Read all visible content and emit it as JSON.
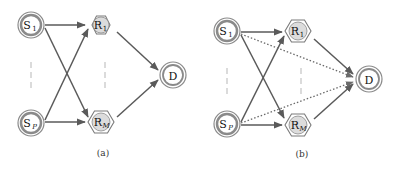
{
  "panels": [
    {
      "id": "a",
      "caption": "(a)",
      "nodes": {
        "s1": {
          "main": "S",
          "sub": "1",
          "shape": "double-circle"
        },
        "sp": {
          "main": "S",
          "sub": "P",
          "shape": "double-circle"
        },
        "r1": {
          "main": "R",
          "sub": "1",
          "shape": "hexagon-filled-circle"
        },
        "rm": {
          "main": "R",
          "sub": "M",
          "shape": "hexagon-filled-circle"
        },
        "d": {
          "main": "D",
          "shape": "double-circle"
        }
      },
      "edges": [
        {
          "from": "S1",
          "to": "R1",
          "style": "solid"
        },
        {
          "from": "S1",
          "to": "RM",
          "style": "solid"
        },
        {
          "from": "SP",
          "to": "R1",
          "style": "solid"
        },
        {
          "from": "SP",
          "to": "RM",
          "style": "solid"
        },
        {
          "from": "R1",
          "to": "D",
          "style": "solid"
        },
        {
          "from": "RM",
          "to": "D",
          "style": "solid"
        }
      ]
    },
    {
      "id": "b",
      "caption": "(b)",
      "nodes": {
        "s1": {
          "main": "S",
          "sub": "1",
          "shape": "double-circle"
        },
        "sp": {
          "main": "S",
          "sub": "P",
          "shape": "double-circle"
        },
        "r1": {
          "main": "R",
          "sub": "1",
          "shape": "hexagon-filled-circle"
        },
        "rm": {
          "main": "R",
          "sub": "M",
          "shape": "hexagon-filled-circle"
        },
        "d": {
          "main": "D",
          "shape": "double-circle"
        }
      },
      "edges": [
        {
          "from": "S1",
          "to": "R1",
          "style": "solid"
        },
        {
          "from": "S1",
          "to": "RM",
          "style": "solid"
        },
        {
          "from": "SP",
          "to": "R1",
          "style": "solid"
        },
        {
          "from": "SP",
          "to": "RM",
          "style": "solid"
        },
        {
          "from": "R1",
          "to": "D",
          "style": "solid"
        },
        {
          "from": "RM",
          "to": "D",
          "style": "solid"
        },
        {
          "from": "S1",
          "to": "D",
          "style": "dotted"
        },
        {
          "from": "SP",
          "to": "D",
          "style": "dotted"
        }
      ]
    }
  ],
  "colors": {
    "edge": "#5a5a5a",
    "node_ring": "#8a8a8a",
    "node_fill": "#e6e6e6",
    "relay_fill": "#dcdcdc",
    "ellipsis": "#c8c8c8"
  }
}
